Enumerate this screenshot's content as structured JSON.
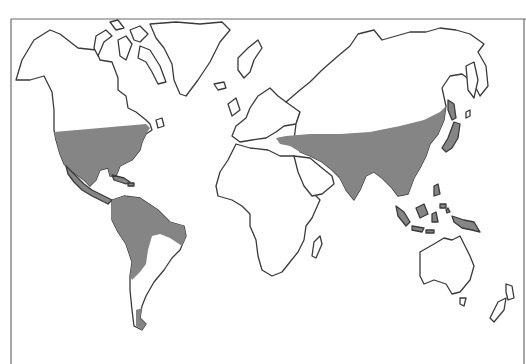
{
  "map": {
    "type": "world-outline-map",
    "projection": "simplified world outline",
    "colors": {
      "background": "#ffffff",
      "coastline": "#3a3a3a",
      "shaded_region": "#858585",
      "frame": "#6a6a6a"
    },
    "legend": null,
    "text_labels": [],
    "shaded_regions": [
      {
        "name": "Eastern North America & Central America",
        "id": "na-central"
      },
      {
        "name": "Northern and western South America",
        "id": "south-america"
      },
      {
        "name": "Southern tip of South America",
        "id": "sa-tip"
      },
      {
        "name": "Southern Eurasia (Mediterranean to East Asia, India, Southeast Asia)",
        "id": "eurasia"
      },
      {
        "name": "Japan",
        "id": "japan"
      },
      {
        "name": "Caribbean islands",
        "id": "caribbean"
      },
      {
        "name": "Indonesia / Maritime Southeast Asia",
        "id": "indonesia"
      },
      {
        "name": "New Guinea",
        "id": "new-guinea"
      }
    ],
    "unshaded_regions": [
      "Canada / Alaska",
      "Greenland",
      "Northern Europe",
      "Africa",
      "Arabia",
      "Siberia",
      "Australia",
      "New Zealand",
      "Madagascar"
    ]
  }
}
